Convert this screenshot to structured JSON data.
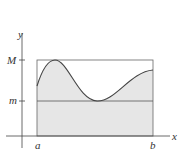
{
  "diagram": {
    "axis_labels": {
      "x": "x",
      "y": "y"
    },
    "interval_labels": {
      "left": "a",
      "right": "b"
    },
    "level_labels": {
      "max": "M",
      "min": "m"
    },
    "colors": {
      "fill": "#e6e6e6",
      "stroke": "#555555",
      "axis": "#444444"
    }
  }
}
